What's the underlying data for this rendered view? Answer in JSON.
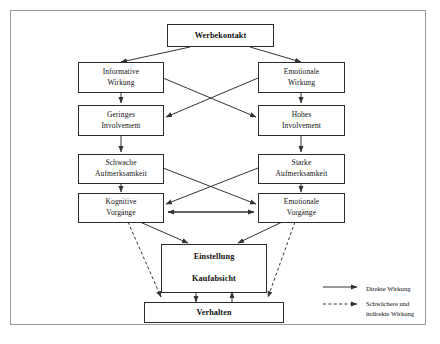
{
  "diagram": {
    "frame": {
      "border_color": "#9a9a9a"
    },
    "nodes": {
      "werbekontakt": {
        "label": "Werbekontakt"
      },
      "informative_wirkung": {
        "line1": "Informative",
        "line2": "Wirkung"
      },
      "emotionale_wirkung": {
        "line1": "Emotionale",
        "line2": "Wirkung"
      },
      "geringes_involvement": {
        "line1": "Geringes",
        "line2": "Involvement"
      },
      "hohes_involvement": {
        "line1": "Hohes",
        "line2": "Involvement"
      },
      "schwache_aufmerksamkeit": {
        "line1": "Schwache",
        "line2": "Aufmerksamkeit"
      },
      "starke_aufmerksamkeit": {
        "line1": "Starke",
        "line2": "Aufmerksamkeit"
      },
      "kognitive_vorgaenge": {
        "line1": "Kognitive",
        "line2": "Vorgänge"
      },
      "emotionale_vorgaenge": {
        "line1": "Emotionale",
        "line2": "Vorgänge"
      },
      "einstellung_kaufabsicht": {
        "line1": "Einstellung",
        "line2": "Kaufabsicht"
      },
      "verhalten": {
        "label": "Verhalten"
      }
    },
    "legend": {
      "direct": {
        "label": "Direkte Wirkung",
        "style": "solid",
        "color": "#333333"
      },
      "indirect": {
        "line1": "Schwächere und",
        "line2": "indirekte Wirkung",
        "style": "dashed",
        "color": "#333333"
      }
    },
    "edge_color": "#333333"
  }
}
